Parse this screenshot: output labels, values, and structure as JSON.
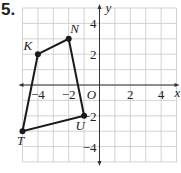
{
  "problem_number": "5.",
  "chart_data": {
    "type": "scatter",
    "title": "",
    "xlabel": "x",
    "ylabel": "y",
    "xlim": [
      -5,
      5
    ],
    "ylim": [
      -5,
      5
    ],
    "grid": true,
    "x_tick_labels": [
      "-4",
      "-2",
      "2",
      "4"
    ],
    "y_tick_labels": [
      "4",
      "2",
      "-2",
      "-4"
    ],
    "origin_label": "O",
    "polygon": {
      "name": "KNUT",
      "closed": true,
      "vertices": [
        {
          "label": "K",
          "x": -4,
          "y": 2
        },
        {
          "label": "N",
          "x": -2,
          "y": 3
        },
        {
          "label": "U",
          "x": -1,
          "y": -2
        },
        {
          "label": "T",
          "x": -5,
          "y": -3
        }
      ]
    }
  },
  "colors": {
    "grid": "#c8c8c8",
    "axis": "#333333",
    "polygon": "#1a1a1a",
    "text": "#222222"
  }
}
